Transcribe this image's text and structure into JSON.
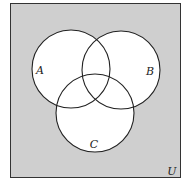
{
  "diagram": {
    "type": "venn",
    "universe": {
      "label": "U",
      "fill": "#cfcfcf",
      "stroke": "#333333",
      "x": 10,
      "y": 3,
      "width": 171,
      "height": 175
    },
    "sets": [
      {
        "id": "A",
        "label": "A",
        "cx": 71,
        "cy": 69,
        "r": 39,
        "label_x": 40,
        "label_y": 74
      },
      {
        "id": "B",
        "label": "B",
        "cx": 121,
        "cy": 70,
        "r": 39,
        "label_x": 150,
        "label_y": 75
      },
      {
        "id": "C",
        "label": "C",
        "cx": 95,
        "cy": 113,
        "r": 39,
        "label_x": 94,
        "label_y": 148
      }
    ],
    "circle_fill": "#ffffff",
    "circle_stroke": "#222222",
    "universe_label_x": 172,
    "universe_label_y": 175
  }
}
